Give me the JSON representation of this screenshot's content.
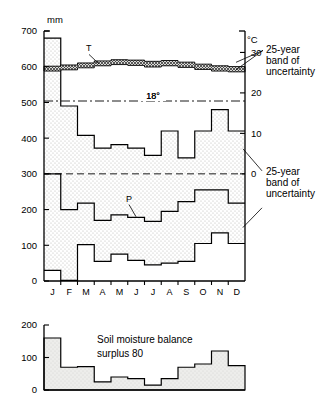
{
  "figure": {
    "left_axis_unit": "mm",
    "right_axis_unit": "°C",
    "annotations": [
      {
        "id": "temp-band-note",
        "lines": [
          "25-year",
          "band of",
          "uncertainty"
        ]
      },
      {
        "id": "precip-band-note",
        "lines": [
          "25-year",
          "band of",
          "uncertainty"
        ]
      }
    ],
    "series_labels": {
      "temperature": "T",
      "precipitation": "P"
    },
    "reference_line_label": "18°",
    "lower_panel": {
      "title_line1": "Soil moisture balance",
      "title_line2": "surplus 80"
    },
    "colors": {
      "fill_precip": "#e8e8e6",
      "fill_soil": "#e6e6e4",
      "line": "#000000",
      "hatch": "#4a4a4a"
    }
  },
  "chart_data": [
    {
      "type": "area",
      "id": "climate-main",
      "title": "",
      "xlabel": "",
      "ylabel": "mm",
      "categories": [
        "J",
        "F",
        "M",
        "A",
        "M",
        "J",
        "J",
        "A",
        "S",
        "O",
        "N",
        "D"
      ],
      "ylim": [
        0,
        700
      ],
      "yticks": [
        0,
        100,
        200,
        300,
        400,
        500,
        600,
        700
      ],
      "y2label": "°C",
      "y2lim": [
        0,
        30
      ],
      "y2ticks": [
        0,
        10,
        20,
        30
      ],
      "grid": false,
      "legend": "none",
      "reference_lines": [
        {
          "label": "18°",
          "value_celsius": 18,
          "value_mm": 504,
          "style": "dash-dot"
        },
        {
          "label": "0",
          "value_celsius": 0,
          "value_mm": 300,
          "style": "dashed"
        }
      ],
      "series": [
        {
          "name": "precipitation upper bound (mm)",
          "key": "precip_upper",
          "values": [
            680,
            490,
            408,
            372,
            382,
            372,
            352,
            420,
            345,
            420,
            480,
            420
          ]
        },
        {
          "name": "precipitation lower bound (mm)",
          "key": "precip_lower",
          "values": [
            30,
            2,
            102,
            55,
            75,
            58,
            45,
            50,
            55,
            105,
            135,
            105
          ]
        },
        {
          "name": "precipitation mid band upper (mm)",
          "key": "precip_band_upper",
          "values": [
            300,
            200,
            218,
            170,
            185,
            178,
            167,
            195,
            222,
            255,
            255,
            218
          ]
        },
        {
          "name": "temperature band upper (°C)",
          "key": "temp_upper",
          "values": [
            26.6,
            26.9,
            27.4,
            27.9,
            28.2,
            28.1,
            27.8,
            28.0,
            27.6,
            27.1,
            26.7,
            26.5
          ]
        },
        {
          "name": "temperature band lower (°C)",
          "key": "temp_lower",
          "values": [
            25.4,
            25.7,
            26.2,
            26.7,
            27.0,
            26.8,
            26.4,
            26.7,
            26.3,
            25.8,
            25.4,
            25.2
          ]
        }
      ]
    },
    {
      "type": "bar",
      "id": "soil-moisture-balance",
      "title": "Soil moisture balance surplus 80",
      "xlabel": "",
      "ylabel": "",
      "categories": [
        "J",
        "F",
        "M",
        "A",
        "M",
        "J",
        "J",
        "A",
        "S",
        "O",
        "N",
        "D"
      ],
      "values": [
        160,
        70,
        72,
        25,
        40,
        35,
        15,
        35,
        70,
        80,
        120,
        75
      ],
      "ylim": [
        0,
        200
      ],
      "yticks": [
        0,
        100,
        200
      ],
      "grid": false,
      "legend": "none"
    }
  ]
}
